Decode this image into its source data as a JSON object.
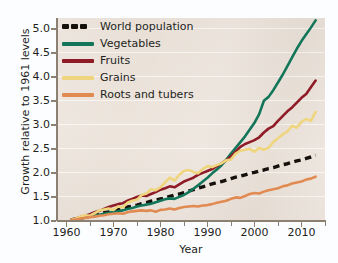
{
  "chart_data": {
    "type": "line",
    "title": "",
    "xlabel": "Year",
    "ylabel": "Growth relative to 1961 levels",
    "xlim": [
      1958,
      2015
    ],
    "ylim": [
      1.0,
      5.2
    ],
    "grid": true,
    "legend_position": "top-left",
    "xticks": [
      1960,
      1970,
      1980,
      1990,
      2000,
      2010
    ],
    "xtick_labels": [
      "1960",
      "1970",
      "1980",
      "1990",
      "2000",
      "2010"
    ],
    "xminor_ticks": [
      1965,
      1975,
      1985,
      1995,
      2005,
      2015
    ],
    "yticks": [
      1.0,
      1.5,
      2.0,
      2.5,
      3.0,
      3.5,
      4.0,
      4.5,
      5.0
    ],
    "ytick_labels": [
      "1.0",
      "1.5",
      "2.0",
      "2.5",
      "3.0",
      "3.5",
      "4.0",
      "4.5",
      "5.0"
    ],
    "x": [
      1961,
      1962,
      1963,
      1964,
      1965,
      1966,
      1967,
      1968,
      1969,
      1970,
      1971,
      1972,
      1973,
      1974,
      1975,
      1976,
      1977,
      1978,
      1979,
      1980,
      1981,
      1982,
      1983,
      1984,
      1985,
      1986,
      1987,
      1988,
      1989,
      1990,
      1991,
      1992,
      1993,
      1994,
      1995,
      1996,
      1997,
      1998,
      1999,
      2000,
      2001,
      2002,
      2003,
      2004,
      2005,
      2006,
      2007,
      2008,
      2009,
      2010,
      2011,
      2012,
      2013
    ],
    "series": [
      {
        "name": "World population",
        "color": "#15100c",
        "style": "dashed",
        "values": [
          1.0,
          1.02,
          1.04,
          1.06,
          1.08,
          1.1,
          1.13,
          1.15,
          1.17,
          1.2,
          1.22,
          1.24,
          1.27,
          1.29,
          1.31,
          1.34,
          1.36,
          1.39,
          1.41,
          1.44,
          1.46,
          1.49,
          1.52,
          1.54,
          1.57,
          1.6,
          1.63,
          1.66,
          1.69,
          1.72,
          1.75,
          1.78,
          1.8,
          1.83,
          1.86,
          1.89,
          1.91,
          1.94,
          1.97,
          1.99,
          2.02,
          2.04,
          2.07,
          2.09,
          2.12,
          2.15,
          2.17,
          2.2,
          2.23,
          2.25,
          2.28,
          2.31,
          2.35
        ]
      },
      {
        "name": "Vegetables",
        "color": "#13765a",
        "style": "solid",
        "values": [
          1.0,
          1.01,
          1.03,
          1.05,
          1.07,
          1.1,
          1.11,
          1.13,
          1.15,
          1.17,
          1.18,
          1.2,
          1.23,
          1.25,
          1.28,
          1.3,
          1.32,
          1.34,
          1.37,
          1.4,
          1.43,
          1.45,
          1.44,
          1.48,
          1.52,
          1.58,
          1.65,
          1.72,
          1.8,
          1.88,
          1.97,
          2.05,
          2.14,
          2.25,
          2.38,
          2.5,
          2.62,
          2.74,
          2.88,
          3.02,
          3.2,
          3.48,
          3.56,
          3.7,
          3.86,
          4.02,
          4.2,
          4.38,
          4.56,
          4.72,
          4.86,
          5.0,
          5.15
        ]
      },
      {
        "name": "Fruits",
        "color": "#8e1b26",
        "style": "solid",
        "values": [
          1.0,
          1.03,
          1.06,
          1.09,
          1.12,
          1.16,
          1.19,
          1.23,
          1.27,
          1.3,
          1.33,
          1.35,
          1.4,
          1.44,
          1.48,
          1.51,
          1.5,
          1.54,
          1.58,
          1.63,
          1.66,
          1.7,
          1.68,
          1.74,
          1.8,
          1.84,
          1.88,
          1.94,
          1.98,
          2.02,
          2.06,
          2.12,
          2.18,
          2.24,
          2.32,
          2.42,
          2.52,
          2.58,
          2.62,
          2.66,
          2.72,
          2.82,
          2.9,
          2.95,
          3.06,
          3.16,
          3.26,
          3.34,
          3.44,
          3.54,
          3.62,
          3.76,
          3.9
        ]
      },
      {
        "name": "Grains",
        "color": "#efd57d",
        "style": "solid",
        "values": [
          1.0,
          1.03,
          1.07,
          1.1,
          1.09,
          1.14,
          1.2,
          1.22,
          1.24,
          1.21,
          1.28,
          1.26,
          1.36,
          1.4,
          1.42,
          1.52,
          1.55,
          1.64,
          1.62,
          1.68,
          1.78,
          1.88,
          1.82,
          1.94,
          2.02,
          2.04,
          2.0,
          1.97,
          2.06,
          2.12,
          2.1,
          2.14,
          2.18,
          2.24,
          2.26,
          2.38,
          2.44,
          2.46,
          2.48,
          2.42,
          2.5,
          2.46,
          2.5,
          2.62,
          2.7,
          2.78,
          2.84,
          2.96,
          2.92,
          3.04,
          3.1,
          3.06,
          3.25
        ]
      },
      {
        "name": "Roots and tubers",
        "color": "#e18a52",
        "style": "solid",
        "values": [
          1.0,
          1.01,
          1.03,
          1.04,
          1.06,
          1.07,
          1.09,
          1.1,
          1.12,
          1.13,
          1.14,
          1.13,
          1.16,
          1.18,
          1.19,
          1.2,
          1.19,
          1.2,
          1.17,
          1.21,
          1.22,
          1.24,
          1.22,
          1.25,
          1.27,
          1.28,
          1.29,
          1.28,
          1.3,
          1.31,
          1.33,
          1.36,
          1.38,
          1.4,
          1.44,
          1.47,
          1.46,
          1.5,
          1.54,
          1.56,
          1.55,
          1.59,
          1.62,
          1.64,
          1.66,
          1.7,
          1.72,
          1.76,
          1.78,
          1.8,
          1.84,
          1.86,
          1.9
        ]
      }
    ]
  },
  "legend": {
    "items": [
      {
        "label": "World population"
      },
      {
        "label": "Vegetables"
      },
      {
        "label": "Fruits"
      },
      {
        "label": "Grains"
      },
      {
        "label": "Roots and tubers"
      }
    ]
  }
}
